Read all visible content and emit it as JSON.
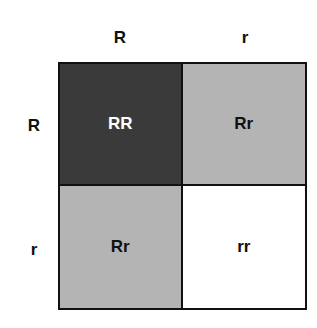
{
  "punnett": {
    "columns": [
      "R",
      "r"
    ],
    "rows": [
      "R",
      "r"
    ],
    "cells": [
      {
        "genotype": "RR",
        "fill": "#3a3a3a",
        "text_color": "#ffffff"
      },
      {
        "genotype": "Rr",
        "fill": "#b4b4b4",
        "text_color": "#111111"
      },
      {
        "genotype": "Rr",
        "fill": "#b4b4b4",
        "text_color": "#111111"
      },
      {
        "genotype": "rr",
        "fill": "#ffffff",
        "text_color": "#111111"
      }
    ]
  }
}
